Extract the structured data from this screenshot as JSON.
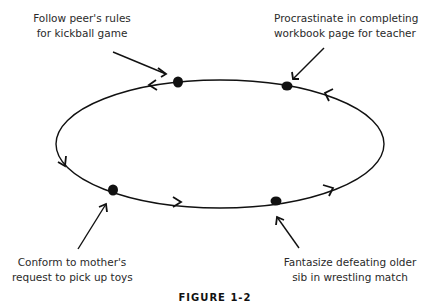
{
  "diagram": {
    "type": "cycle",
    "direction": "counter-clockwise",
    "nodes": [
      {
        "id": "kickball",
        "lines": [
          "Follow peer's rules",
          "for kickball game"
        ]
      },
      {
        "id": "workbook",
        "lines": [
          "Procrastinate in completing",
          "workbook page for teacher"
        ]
      },
      {
        "id": "toys",
        "lines": [
          "Conform to mother's",
          "request to pick up toys"
        ]
      },
      {
        "id": "wrestling",
        "lines": [
          "Fantasize defeating older",
          "sib in wrestling match"
        ]
      }
    ],
    "caption": "FIGURE 1-2",
    "line_color": "#111111"
  }
}
